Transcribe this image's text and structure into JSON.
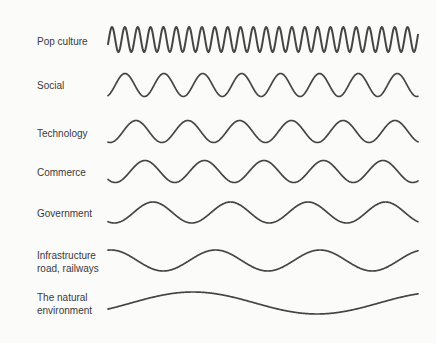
{
  "diagram": {
    "title": "",
    "stroke_color": "#454545",
    "text_color": "#3a3a3a",
    "background": "#fbfbfa",
    "x_start": 108,
    "x_end": 418
  },
  "rows": [
    {
      "id": "pop-culture",
      "label_lines": [
        "Pop culture"
      ],
      "label_y": 35,
      "center_y": 39.5,
      "amplitude": 12.5,
      "period": 12.85,
      "first_peak_x": 112,
      "stroke_width": 2
    },
    {
      "id": "social",
      "label_lines": [
        "Social"
      ],
      "label_y": 79,
      "center_y": 85,
      "amplitude": 11.5,
      "period": 38.9,
      "first_peak_x": 125,
      "stroke_width": 1.7
    },
    {
      "id": "technology",
      "label_lines": [
        "Technology"
      ],
      "label_y": 127,
      "center_y": 131.5,
      "amplitude": 11,
      "period": 51.8,
      "first_peak_x": 136,
      "stroke_width": 1.7
    },
    {
      "id": "commerce",
      "label_lines": [
        "Commerce"
      ],
      "label_y": 166,
      "center_y": 171.5,
      "amplitude": 11,
      "period": 59.5,
      "first_peak_x": 145,
      "stroke_width": 1.7
    },
    {
      "id": "government",
      "label_lines": [
        "Government"
      ],
      "label_y": 207,
      "center_y": 212.5,
      "amplitude": 10.5,
      "period": 77.5,
      "first_peak_x": 153,
      "stroke_width": 1.7
    },
    {
      "id": "infrastructure",
      "label_lines": [
        "Infrastructure",
        "road, railways"
      ],
      "label_y": 249,
      "center_y": 260.5,
      "amplitude": 10.5,
      "period": 104.5,
      "first_peak_x": 111,
      "stroke_width": 1.7
    },
    {
      "id": "natural-environment",
      "label_lines": [
        "The natural",
        "environment"
      ],
      "label_y": 291,
      "center_y": 303,
      "amplitude": 11,
      "period": 248,
      "first_peak_x": 193,
      "stroke_width": 1.7
    }
  ],
  "labels": {
    "pop_culture": "Pop culture",
    "social": "Social",
    "technology": "Technology",
    "commerce": "Commerce",
    "government": "Government",
    "infrastructure_1": "Infrastructure",
    "infrastructure_2": "road, railways",
    "natural_1": "The natural",
    "natural_2": "environment"
  }
}
